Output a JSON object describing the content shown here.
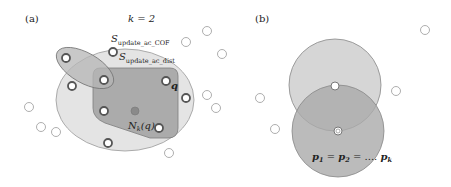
{
  "panel_a": {
    "label": "(a)",
    "k_label": "k = 2",
    "cof_label_main": "S",
    "cof_label_sub": "update_ac_COF",
    "dist_label_main": "S",
    "dist_label_sub": "update_ac_dist",
    "q_label": "q",
    "nk_label_main": "N",
    "nk_label_sub": "k",
    "nk_label_arg": "(q)"
  },
  "panel_b": {
    "label": "(b)",
    "eq_p1": "p",
    "eq_s1": "1",
    "eq_eq1": " = ",
    "eq_p2": "p",
    "eq_s2": "2",
    "eq_eq2": " = .... ",
    "eq_pk": "p",
    "eq_sk": "k"
  },
  "colors": {
    "outer_ellipse": "#e4e4e4",
    "dist_region": "#a9a9a9",
    "small_ellipse": "#b5b5b5",
    "center_point": "#8a8a8a",
    "circle_top": "#d6d6d6",
    "circle_bottom": "#b0b0b0"
  }
}
